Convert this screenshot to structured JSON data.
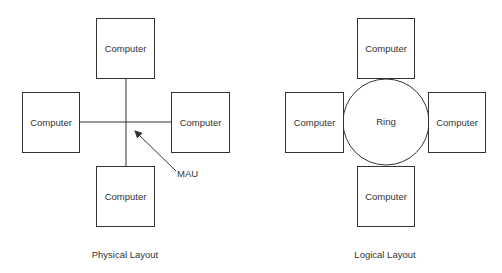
{
  "physical": {
    "caption": "Physical Layout",
    "hub_label": "MAU",
    "nodes": [
      {
        "label": "Computer",
        "position": "top"
      },
      {
        "label": "Computer",
        "position": "left"
      },
      {
        "label": "Computer",
        "position": "right"
      },
      {
        "label": "Computer",
        "position": "bottom"
      }
    ]
  },
  "logical": {
    "caption": "Logical Layout",
    "ring_label": "Ring",
    "nodes": [
      {
        "label": "Computer",
        "position": "top"
      },
      {
        "label": "Computer",
        "position": "left"
      },
      {
        "label": "Computer",
        "position": "right"
      },
      {
        "label": "Computer",
        "position": "bottom"
      }
    ]
  }
}
